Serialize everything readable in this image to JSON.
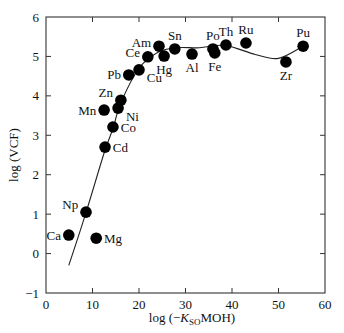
{
  "chart_data": {
    "type": "scatter",
    "title": "",
    "xlabel": "log (−K_SO MOH)",
    "xlabel_parts": {
      "prefix": "log (−",
      "k": "K",
      "sub": "SO",
      "suffix": "MOH)"
    },
    "ylabel": "log (VCF)",
    "xlim": [
      0,
      60
    ],
    "ylim": [
      -1,
      6
    ],
    "xticks": [
      0,
      10,
      20,
      30,
      40,
      50,
      60
    ],
    "yticks": [
      -1,
      0,
      1,
      2,
      3,
      4,
      5,
      6
    ],
    "xtick_labels": [
      "0",
      "10",
      "20",
      "30",
      "40",
      "50",
      "60"
    ],
    "ytick_labels": [
      "−1",
      "0",
      "1",
      "2",
      "3",
      "4",
      "5",
      "6"
    ],
    "grid": false,
    "legend": null,
    "marker_color": "#000000",
    "points": [
      {
        "label": "Ca",
        "x": 4.9,
        "y": 0.47,
        "lx": -2,
        "ly": 0,
        "anchor": "end"
      },
      {
        "label": "Np",
        "x": 8.6,
        "y": 1.05,
        "lx": -2,
        "ly": -1,
        "anchor": "end"
      },
      {
        "label": "Mg",
        "x": 10.8,
        "y": 0.39,
        "lx": 1,
        "ly": 0,
        "anchor": "start"
      },
      {
        "label": "Cd",
        "x": 12.7,
        "y": 2.7,
        "lx": 1,
        "ly": 0,
        "anchor": "start"
      },
      {
        "label": "Co",
        "x": 14.4,
        "y": 3.21,
        "lx": 1,
        "ly": 0,
        "anchor": "start"
      },
      {
        "label": "Mn",
        "x": 12.5,
        "y": 3.64,
        "lx": -2,
        "ly": 0,
        "anchor": "end"
      },
      {
        "label": "Ni",
        "x": 15.5,
        "y": 3.69,
        "lx": 1,
        "ly": 1,
        "anchor": "start"
      },
      {
        "label": "Zn",
        "x": 16.1,
        "y": 3.89,
        "lx": -2,
        "ly": -1,
        "anchor": "end"
      },
      {
        "label": "Pb",
        "x": 17.8,
        "y": 4.53,
        "lx": -2,
        "ly": 0,
        "anchor": "end"
      },
      {
        "label": "Cu",
        "x": 20.0,
        "y": 4.66,
        "lx": 1,
        "ly": 1,
        "anchor": "start"
      },
      {
        "label": "Ce",
        "x": 21.9,
        "y": 4.99,
        "lx": -2,
        "ly": -0.5,
        "anchor": "end"
      },
      {
        "label": "Am",
        "x": 24.3,
        "y": 5.26,
        "lx": -2,
        "ly": -0.5,
        "anchor": "end"
      },
      {
        "label": "Hg",
        "x": 25.4,
        "y": 5.01,
        "lx": 0,
        "ly": 1,
        "anchor": "middle"
      },
      {
        "label": "Sn",
        "x": 27.7,
        "y": 5.19,
        "lx": 0,
        "ly": -1,
        "anchor": "middle"
      },
      {
        "label": "Al",
        "x": 31.4,
        "y": 5.06,
        "lx": 0,
        "ly": 1,
        "anchor": "middle"
      },
      {
        "label": "Po",
        "x": 35.9,
        "y": 5.19,
        "lx": 0,
        "ly": -1,
        "anchor": "middle"
      },
      {
        "label": "Fe",
        "x": 36.3,
        "y": 5.09,
        "lx": 0,
        "ly": 1,
        "anchor": "middle"
      },
      {
        "label": "Th",
        "x": 38.7,
        "y": 5.29,
        "lx": 0,
        "ly": -1,
        "anchor": "middle"
      },
      {
        "label": "Ru",
        "x": 43.0,
        "y": 5.34,
        "lx": 0,
        "ly": -1,
        "anchor": "middle"
      },
      {
        "label": "Zr",
        "x": 51.6,
        "y": 4.86,
        "lx": 0,
        "ly": 1,
        "anchor": "middle"
      },
      {
        "label": "Pu",
        "x": 55.3,
        "y": 5.26,
        "lx": 0,
        "ly": -1,
        "anchor": "middle"
      }
    ],
    "fit_curve": {
      "x": [
        4.9,
        8.5,
        12.5,
        14.5,
        16.0,
        20.0,
        24.0,
        28.0,
        33.0,
        38.5,
        45.0,
        50.0,
        55.3
      ],
      "y": [
        -0.3,
        1.0,
        2.55,
        3.2,
        3.8,
        4.7,
        5.1,
        5.22,
        5.22,
        5.28,
        5.05,
        4.95,
        5.26
      ]
    }
  }
}
